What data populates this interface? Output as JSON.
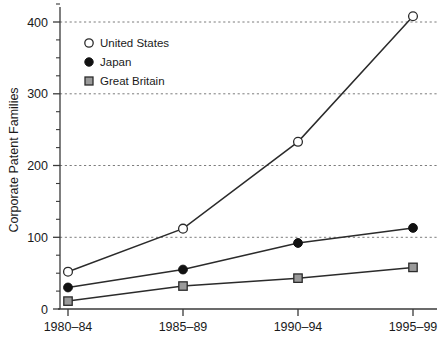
{
  "chart_data": {
    "type": "line",
    "title": "",
    "subtitle": "",
    "xlabel": "",
    "ylabel": "Corporate Patent Families",
    "categories": [
      "1980–84",
      "1985–89",
      "1990–94",
      "1995–99"
    ],
    "ylim": [
      0,
      420
    ],
    "xlim": [
      0,
      3
    ],
    "yticks": [
      0,
      100,
      200,
      300,
      400
    ],
    "ytick_labels": [
      "0",
      "100",
      "200",
      "300",
      "400"
    ],
    "yminor_step": 25,
    "grid": "horizontal-dashed-at-major-above-zero",
    "legend_position": "upper-left-inside",
    "series": [
      {
        "name": "United States",
        "marker": "open-circle",
        "marker_fill": "#ffffff",
        "marker_stroke": "#2b2b2b",
        "line_color": "#2b2b2b",
        "values": [
          52,
          112,
          233,
          408
        ]
      },
      {
        "name": "Japan",
        "marker": "filled-circle",
        "marker_fill": "#111111",
        "marker_stroke": "#111111",
        "line_color": "#2b2b2b",
        "values": [
          30,
          55,
          92,
          113
        ]
      },
      {
        "name": "Great Britain",
        "marker": "gray-square",
        "marker_fill": "#9a9a9a",
        "marker_stroke": "#2b2b2b",
        "line_color": "#2b2b2b",
        "values": [
          11,
          32,
          43,
          58
        ]
      }
    ]
  },
  "legend": {
    "entries": [
      {
        "label": "United States",
        "icon": "open-circle-marker-icon"
      },
      {
        "label": "Japan",
        "icon": "filled-circle-marker-icon"
      },
      {
        "label": "Great Britain",
        "icon": "gray-square-marker-icon"
      }
    ]
  },
  "axes": {
    "y_title": "Corporate Patent Families",
    "y_tick_labels": [
      "400",
      "300",
      "200",
      "100",
      "0"
    ],
    "x_tick_labels": [
      "1980–84",
      "1985–89",
      "1990–94",
      "1995–99"
    ]
  },
  "colors": {
    "axis": "#3a3a3a",
    "grid": "#7d7d7d",
    "line": "#2b2b2b",
    "text": "#1a1a1a",
    "background": "#ffffff",
    "gb_marker": "#9a9a9a"
  }
}
